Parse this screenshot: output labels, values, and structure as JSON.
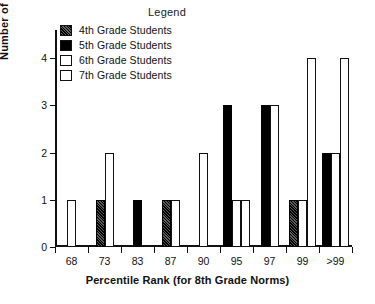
{
  "chart_data": {
    "type": "bar",
    "title": "",
    "legend_title": "Legend",
    "legend_position": "top-center",
    "xlabel": "Percentile Rank (for 8th Grade Norms)",
    "ylabel": "Number of Students",
    "categories": [
      "68",
      "73",
      "83",
      "87",
      "90",
      "95",
      "97",
      "99",
      ">99"
    ],
    "ylim": [
      0,
      4.6
    ],
    "yticks": [
      0,
      1,
      2,
      3,
      4
    ],
    "ytick_labels": [
      "0",
      "1",
      "2",
      "3",
      "4"
    ],
    "grid": false,
    "series": [
      {
        "name": "4th Grade Students",
        "key": "g4",
        "fill": "hatched-dark",
        "color": "#2b2b2b",
        "values": [
          0,
          1,
          0,
          1,
          0,
          0,
          0,
          1,
          0
        ]
      },
      {
        "name": "5th Grade Students",
        "key": "g5",
        "fill": "solid-black",
        "color": "#000000",
        "values": [
          0,
          0,
          1,
          0,
          0,
          3,
          3,
          0,
          2
        ]
      },
      {
        "name": "6th Grade Students",
        "key": "g6",
        "fill": "white-outline",
        "color": "#ffffff",
        "values": [
          1,
          2,
          0,
          1,
          2,
          1,
          3,
          1,
          2
        ]
      },
      {
        "name": "7th Grade Students",
        "key": "g7",
        "fill": "white-outline",
        "color": "#ffffff",
        "values": [
          0,
          0,
          0,
          0,
          0,
          1,
          0,
          4,
          4
        ]
      }
    ]
  },
  "legend": {
    "title": "Legend",
    "items": [
      {
        "label": "4th Grade Students",
        "swatch": "hatched-dark-swatch"
      },
      {
        "label": "5th Grade Students",
        "swatch": "solid-black-swatch"
      },
      {
        "label": "6th Grade Students",
        "swatch": "white-outline-swatch"
      },
      {
        "label": "7th Grade Students",
        "swatch": "white-outline-swatch"
      }
    ]
  },
  "axes": {
    "y_title": "Number of Students",
    "x_title": "Percentile Rank (for 8th Grade Norms)"
  }
}
